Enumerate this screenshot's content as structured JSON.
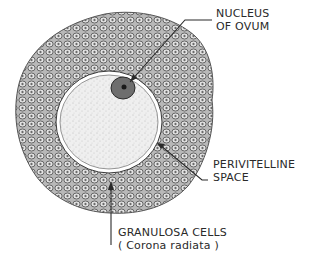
{
  "figure": {
    "colors": {
      "background": "#ffffff",
      "ink": "#2a2a2a",
      "cell_fill": "#c9c9c9",
      "ovum_fill": "#ededed",
      "nucleus_fill": "#5a5a5a"
    }
  },
  "labels": {
    "nucleus": {
      "line1": "NUCLEUS",
      "line2": "OF OVUM"
    },
    "perivitelline": {
      "line1": "PERIVITELLINE",
      "line2": "SPACE"
    },
    "granulosa": {
      "line1": "GRANULOSA CELLS",
      "line2": "( Corona radiata )"
    }
  }
}
